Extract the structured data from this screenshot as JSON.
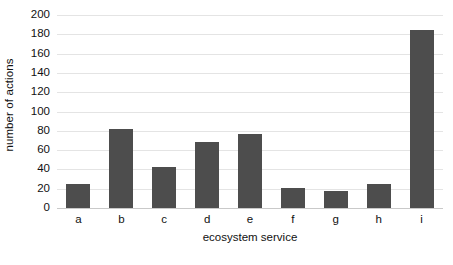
{
  "chart_data": {
    "type": "bar",
    "title": "",
    "xlabel": "ecosystem service",
    "ylabel": "number of actions",
    "categories": [
      "a",
      "b",
      "c",
      "d",
      "e",
      "f",
      "g",
      "h",
      "i"
    ],
    "values": [
      25,
      82,
      43,
      68,
      77,
      21,
      18,
      25,
      184
    ],
    "ylim": [
      0,
      200
    ],
    "ytick_step": 20,
    "yticks": [
      0,
      20,
      40,
      60,
      80,
      100,
      120,
      140,
      160,
      180,
      200
    ],
    "ytick_labels": [
      "0",
      "20",
      "40",
      "60",
      "80",
      "100",
      "120",
      "140",
      "160",
      "180",
      "200"
    ],
    "grid": true,
    "grid_axis": "y",
    "legend": false,
    "legend_position": "none",
    "bar_color": "#4d4d4d",
    "gridline_color": "#e4e4e4",
    "axis_color": "#c9c9c9",
    "background_color": "#ffffff",
    "series": [
      {
        "name": "number of actions",
        "values": [
          25,
          82,
          43,
          68,
          77,
          21,
          18,
          25,
          184
        ]
      }
    ]
  }
}
